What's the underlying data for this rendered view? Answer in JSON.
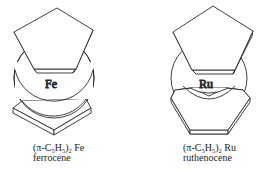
{
  "figure": {
    "stroke_color": "#2a2a2a",
    "background": "#ffffff",
    "molecules": [
      {
        "metal_symbol": "Fe",
        "formula": {
          "prefix": "(π-C",
          "sub1": "5",
          "mid": "H",
          "sub2": "5",
          "close": ")",
          "sub3": "2",
          "metal": " Fe"
        },
        "name": "ferrocene",
        "conformation": "staggered"
      },
      {
        "metal_symbol": "Ru",
        "formula": {
          "prefix": "(π-C",
          "sub1": "5",
          "mid": "H",
          "sub2": "5",
          "close": ")",
          "sub3": "2",
          "metal": " Ru"
        },
        "name": "ruthenocene",
        "conformation": "eclipsed"
      }
    ]
  }
}
